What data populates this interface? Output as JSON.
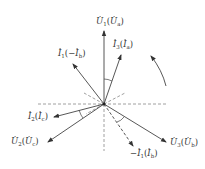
{
  "diagram": {
    "title": "",
    "type": "phasor diagram",
    "center": {
      "x": 104,
      "y": 104
    },
    "colors": {
      "line": "#444444",
      "dashed": "#888888",
      "text": "#333333"
    },
    "phasors": [
      {
        "id": "U1",
        "label_main": "U",
        "label_sub": "1",
        "label_alt": "U",
        "label_alt_sub": "a",
        "neg": false,
        "alt_neg": false,
        "style": "solid"
      },
      {
        "id": "I3",
        "label_main": "I",
        "label_sub": "3",
        "label_alt": "I",
        "label_alt_sub": "a",
        "neg": false,
        "alt_neg": false,
        "style": "solid"
      },
      {
        "id": "I1",
        "label_main": "I",
        "label_sub": "1",
        "label_alt": "I",
        "label_alt_sub": "b",
        "neg": false,
        "alt_neg": true,
        "style": "solid"
      },
      {
        "id": "I2",
        "label_main": "I",
        "label_sub": "2",
        "label_alt": "I",
        "label_alt_sub": "c",
        "neg": false,
        "alt_neg": false,
        "style": "solid"
      },
      {
        "id": "U2",
        "label_main": "U",
        "label_sub": "2",
        "label_alt": "U",
        "label_alt_sub": "c",
        "neg": false,
        "alt_neg": false,
        "style": "solid"
      },
      {
        "id": "U3",
        "label_main": "U",
        "label_sub": "3",
        "label_alt": "U",
        "label_alt_sub": "b",
        "neg": false,
        "alt_neg": false,
        "style": "solid"
      },
      {
        "id": "negI1",
        "label_main": "I",
        "label_sub": "1",
        "label_alt": "I",
        "label_alt_sub": "b",
        "neg": true,
        "alt_neg": false,
        "style": "dashed"
      }
    ],
    "rotation_arrow": "counter-clockwise"
  },
  "labels": {
    "u1": {
      "main": "U",
      "sub": "1",
      "open": "(",
      "alt": "U",
      "alt_sub": "a",
      "close": ")"
    },
    "i3": {
      "main": "I",
      "sub": "3",
      "open": "(",
      "alt": "I",
      "alt_sub": "a",
      "close": ")"
    },
    "i1": {
      "main": "I",
      "sub": "1",
      "open": "(−",
      "alt": "I",
      "alt_sub": "b",
      "close": ")"
    },
    "i2": {
      "main": "I",
      "sub": "2",
      "open": "(",
      "alt": "I",
      "alt_sub": "c",
      "close": ")"
    },
    "u2": {
      "main": "U",
      "sub": "2",
      "open": "(",
      "alt": "U",
      "alt_sub": "c",
      "close": ")"
    },
    "u3": {
      "main": "U",
      "sub": "3",
      "open": "(",
      "alt": "U",
      "alt_sub": "b",
      "close": ")"
    },
    "negi1": {
      "neg": "−",
      "main": "I",
      "sub": "1",
      "open": "(",
      "alt": "I",
      "alt_sub": "b",
      "close": ")"
    }
  }
}
